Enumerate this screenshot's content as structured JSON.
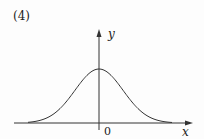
{
  "figure": {
    "label": "(4)",
    "x_axis_label": "x",
    "y_axis_label": "y",
    "origin_label": "0",
    "curve": "bell-shaped (Gaussian) curve symmetric about the y-axis, peak on positive y-axis, asymptotic to x-axis"
  }
}
